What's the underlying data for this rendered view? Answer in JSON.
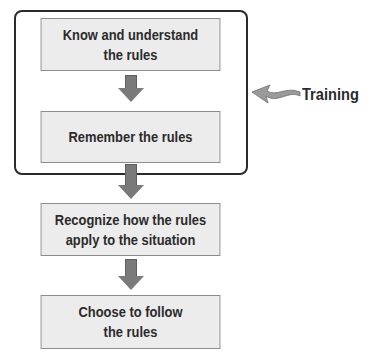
{
  "diagram": {
    "type": "flowchart",
    "steps": [
      {
        "label": "Know and understand\nthe rules"
      },
      {
        "label": "Remember the rules"
      },
      {
        "label": "Recognize how the rules\napply to the situation"
      },
      {
        "label": "Choose to follow\nthe rules"
      }
    ],
    "group": {
      "label": "Training",
      "contains_steps": [
        0,
        1
      ]
    },
    "colors": {
      "box_fill": "#ececec",
      "arrow": "#7a7a7a",
      "border": "#2a2a2a"
    }
  }
}
